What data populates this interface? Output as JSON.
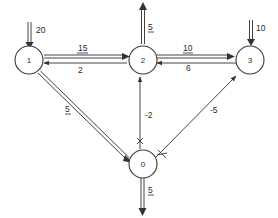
{
  "diagram": {
    "type": "network flow graph",
    "nodes": [
      {
        "id": "1",
        "label": "1"
      },
      {
        "id": "2",
        "label": "2"
      },
      {
        "id": "3",
        "label": "3"
      },
      {
        "id": "0",
        "label": "0"
      }
    ],
    "edges": [
      {
        "from": "1",
        "to": "2",
        "label": "15",
        "underlined": true,
        "style": "double"
      },
      {
        "from": "2",
        "to": "1",
        "label": "2",
        "underlined": false,
        "style": "single"
      },
      {
        "from": "2",
        "to": "3",
        "label": "10",
        "underlined": true,
        "style": "double"
      },
      {
        "from": "3",
        "to": "2",
        "label": "6",
        "underlined": false,
        "style": "single"
      },
      {
        "from": "1",
        "to": "0",
        "label": "5",
        "underlined": true,
        "style": "double"
      },
      {
        "from": "0",
        "to": "2",
        "label": "-2",
        "underlined": false,
        "style": "single",
        "crossed": true
      },
      {
        "from": "0",
        "to": "3",
        "label": "-5",
        "underlined": false,
        "style": "single",
        "crossed": true
      }
    ],
    "external_flows": [
      {
        "node": "1",
        "direction": "in",
        "label": "20",
        "underlined": false
      },
      {
        "node": "2",
        "direction": "out",
        "label": "5",
        "underlined": true
      },
      {
        "node": "3",
        "direction": "in",
        "label": "10",
        "underlined": false
      },
      {
        "node": "0",
        "direction": "out",
        "label": "5",
        "underlined": true
      }
    ]
  }
}
